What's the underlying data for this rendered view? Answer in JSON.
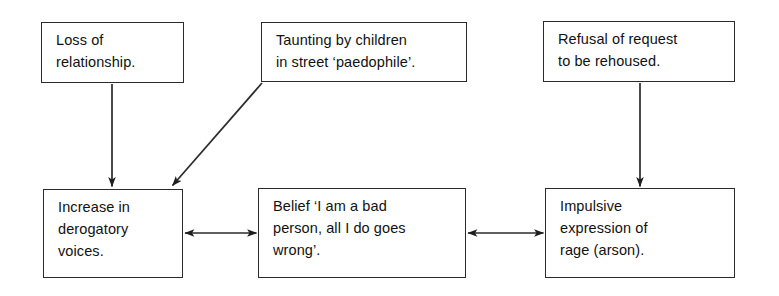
{
  "diagram": {
    "background_color": "#ffffff",
    "line_color": "#2b2b2b",
    "text_color": "#111111",
    "nodes": [
      {
        "id": "loss-of-relationship",
        "text": "Loss of\nrelationship.",
        "x": 41,
        "y": 22,
        "w": 143,
        "h": 61
      },
      {
        "id": "taunting-by-children",
        "text": "Taunting by children\nin street ‘paedophile’.",
        "x": 261,
        "y": 22,
        "w": 206,
        "h": 60
      },
      {
        "id": "refusal-of-request",
        "text": "Refusal of request\nto be rehoused.",
        "x": 543,
        "y": 21,
        "w": 192,
        "h": 61
      },
      {
        "id": "increase-in-derogatory-voices",
        "text": "Increase in\nderogatory\nvoices.",
        "x": 43,
        "y": 189,
        "w": 140,
        "h": 89
      },
      {
        "id": "belief-i-am-a-bad-person",
        "text": "Belief ‘I am a bad\nperson, all I do goes\nwrong’.",
        "x": 258,
        "y": 188,
        "w": 208,
        "h": 90
      },
      {
        "id": "impulsive-expression-of-rage",
        "text": "Impulsive\nexpression of\nrage (arson).",
        "x": 545,
        "y": 188,
        "w": 190,
        "h": 90
      }
    ],
    "connectors": [
      {
        "id": "loss-to-voices",
        "from": "loss-of-relationship",
        "to": "increase-in-derogatory-voices",
        "style": "single-arrow-down",
        "x1": 112,
        "y1": 84,
        "x2": 112,
        "y2": 187
      },
      {
        "id": "taunting-to-voices",
        "from": "taunting-by-children",
        "to": "increase-in-derogatory-voices",
        "style": "single-arrow-diagonal",
        "x1": 262,
        "y1": 83,
        "x2": 171,
        "y2": 186
      },
      {
        "id": "refusal-to-rage",
        "from": "refusal-of-request",
        "to": "impulsive-expression-of-rage",
        "style": "single-arrow-down",
        "x1": 640,
        "y1": 83,
        "x2": 640,
        "y2": 187
      },
      {
        "id": "voices-belief",
        "from": "increase-in-derogatory-voices",
        "to": "belief-i-am-a-bad-person",
        "style": "double-arrow-horizontal",
        "x1": 184,
        "y1": 233,
        "x2": 257,
        "y2": 233
      },
      {
        "id": "belief-rage",
        "from": "belief-i-am-a-bad-person",
        "to": "impulsive-expression-of-rage",
        "style": "double-arrow-horizontal",
        "x1": 467,
        "y1": 233,
        "x2": 544,
        "y2": 233
      }
    ]
  }
}
